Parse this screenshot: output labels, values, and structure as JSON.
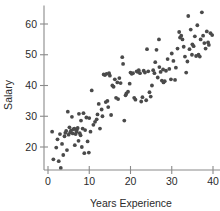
{
  "chart_data": {
    "type": "scatter",
    "title": "",
    "subtitle": "",
    "xlabel": "Years Experience",
    "ylabel": "Salary",
    "xlim": [
      -2,
      41
    ],
    "ylim": [
      11,
      66
    ],
    "xticks": [
      0,
      10,
      20,
      30,
      40
    ],
    "xticklabels": [
      "0",
      "10",
      "20",
      "30",
      "40"
    ],
    "yticks": [
      20,
      30,
      40,
      50,
      60
    ],
    "yticklabels": [
      "20",
      "30",
      "40",
      "50",
      "60"
    ],
    "grid": false,
    "legend": null,
    "marker": "circle",
    "marker_color": "#4a4a4a",
    "marker_size": 1.9,
    "annotations": [],
    "series": [
      {
        "name": "observations",
        "points": [
          [
            1.0,
            25.0
          ],
          [
            1.3,
            16.0
          ],
          [
            2.0,
            19.8
          ],
          [
            2.3,
            22.5
          ],
          [
            2.6,
            15.4
          ],
          [
            2.9,
            24.2
          ],
          [
            3.1,
            13.2
          ],
          [
            3.4,
            21.0
          ],
          [
            3.7,
            17.4
          ],
          [
            4.0,
            23.5
          ],
          [
            4.2,
            24.6
          ],
          [
            4.4,
            25.2
          ],
          [
            4.6,
            19.0
          ],
          [
            4.8,
            31.5
          ],
          [
            5.0,
            24.0
          ],
          [
            5.2,
            26.4
          ],
          [
            5.4,
            24.8
          ],
          [
            5.6,
            25.4
          ],
          [
            5.8,
            29.8
          ],
          [
            6.0,
            24.4
          ],
          [
            6.2,
            25.8
          ],
          [
            6.4,
            26.0
          ],
          [
            6.5,
            20.6
          ],
          [
            6.7,
            24.2
          ],
          [
            6.9,
            25.0
          ],
          [
            7.0,
            25.6
          ],
          [
            7.2,
            26.2
          ],
          [
            7.4,
            22.0
          ],
          [
            7.5,
            30.8
          ],
          [
            7.7,
            24.5
          ],
          [
            7.9,
            23.8
          ],
          [
            8.0,
            28.6
          ],
          [
            8.2,
            20.0
          ],
          [
            8.4,
            26.0
          ],
          [
            8.6,
            31.0
          ],
          [
            8.8,
            18.0
          ],
          [
            9.0,
            25.5
          ],
          [
            9.3,
            29.6
          ],
          [
            9.6,
            21.8
          ],
          [
            9.9,
            18.2
          ],
          [
            10.0,
            29.4
          ],
          [
            10.3,
            25.0
          ],
          [
            10.6,
            38.4
          ],
          [
            11.0,
            27.2
          ],
          [
            11.4,
            28.2
          ],
          [
            11.8,
            29.0
          ],
          [
            12.0,
            30.6
          ],
          [
            12.3,
            34.0
          ],
          [
            12.6,
            26.0
          ],
          [
            13.0,
            32.2
          ],
          [
            13.2,
            30.0
          ],
          [
            13.5,
            43.6
          ],
          [
            13.8,
            43.4
          ],
          [
            14.0,
            34.6
          ],
          [
            14.2,
            43.8
          ],
          [
            14.4,
            35.0
          ],
          [
            14.6,
            33.0
          ],
          [
            14.8,
            44.0
          ],
          [
            15.0,
            43.2
          ],
          [
            15.3,
            30.4
          ],
          [
            15.6,
            40.0
          ],
          [
            15.9,
            39.6
          ],
          [
            16.2,
            42.0
          ],
          [
            16.5,
            36.0
          ],
          [
            16.8,
            41.0
          ],
          [
            17.0,
            35.6
          ],
          [
            17.3,
            42.4
          ],
          [
            17.6,
            40.8
          ],
          [
            18.0,
            49.2
          ],
          [
            18.2,
            47.0
          ],
          [
            18.5,
            28.6
          ],
          [
            18.8,
            36.8
          ],
          [
            19.0,
            37.4
          ],
          [
            19.4,
            38.0
          ],
          [
            19.8,
            40.6
          ],
          [
            20.0,
            44.2
          ],
          [
            20.3,
            43.8
          ],
          [
            20.6,
            44.0
          ],
          [
            20.9,
            36.0
          ],
          [
            21.2,
            35.4
          ],
          [
            21.5,
            44.6
          ],
          [
            21.8,
            44.4
          ],
          [
            22.0,
            45.0
          ],
          [
            22.3,
            44.0
          ],
          [
            22.6,
            34.8
          ],
          [
            22.9,
            36.2
          ],
          [
            23.2,
            44.8
          ],
          [
            23.5,
            44.2
          ],
          [
            23.8,
            35.2
          ],
          [
            24.0,
            51.8
          ],
          [
            24.3,
            44.6
          ],
          [
            24.6,
            37.8
          ],
          [
            24.9,
            36.4
          ],
          [
            25.2,
            40.0
          ],
          [
            25.5,
            45.0
          ],
          [
            25.8,
            44.0
          ],
          [
            26.0,
            47.6
          ],
          [
            26.3,
            51.6
          ],
          [
            26.6,
            42.6
          ],
          [
            26.9,
            55.0
          ],
          [
            27.0,
            46.0
          ],
          [
            27.3,
            44.4
          ],
          [
            27.6,
            41.6
          ],
          [
            27.9,
            45.2
          ],
          [
            28.0,
            41.0
          ],
          [
            28.3,
            41.4
          ],
          [
            28.6,
            44.8
          ],
          [
            29.0,
            48.6
          ],
          [
            29.4,
            45.4
          ],
          [
            29.8,
            42.0
          ],
          [
            30.0,
            50.4
          ],
          [
            30.4,
            48.0
          ],
          [
            30.8,
            41.8
          ],
          [
            31.0,
            45.8
          ],
          [
            31.4,
            52.0
          ],
          [
            31.8,
            57.4
          ],
          [
            32.0,
            55.6
          ],
          [
            32.3,
            56.2
          ],
          [
            32.6,
            55.0
          ],
          [
            32.9,
            52.6
          ],
          [
            33.2,
            49.4
          ],
          [
            33.5,
            44.2
          ],
          [
            33.8,
            47.8
          ],
          [
            34.0,
            62.6
          ],
          [
            34.3,
            51.8
          ],
          [
            34.6,
            58.2
          ],
          [
            34.9,
            50.0
          ],
          [
            35.0,
            53.4
          ],
          [
            35.3,
            52.8
          ],
          [
            35.6,
            56.0
          ],
          [
            35.9,
            49.6
          ],
          [
            36.2,
            59.6
          ],
          [
            36.5,
            50.0
          ],
          [
            36.8,
            49.4
          ],
          [
            37.0,
            55.0
          ],
          [
            37.3,
            63.8
          ],
          [
            37.6,
            56.2
          ],
          [
            37.9,
            53.8
          ],
          [
            38.2,
            52.0
          ],
          [
            38.5,
            57.6
          ],
          [
            38.8,
            54.0
          ],
          [
            39.0,
            53.2
          ],
          [
            39.4,
            57.0
          ],
          [
            39.8,
            56.4
          ]
        ]
      }
    ]
  }
}
